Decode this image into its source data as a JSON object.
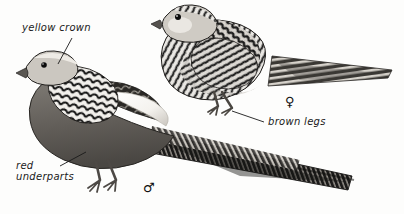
{
  "plate": {
    "background_color": "#fdfdfc",
    "ink_color": "#1a1a1a",
    "width": 404,
    "height": 214
  },
  "annotations": [
    {
      "id": "yellow-crown",
      "text": "yellow crown",
      "x": 22,
      "y": 22
    },
    {
      "id": "red-underparts",
      "text": "red\nunderparts",
      "x": 16,
      "y": 160
    },
    {
      "id": "brown-legs",
      "text": "brown legs",
      "x": 268,
      "y": 116
    }
  ],
  "sex_symbols": [
    {
      "id": "male",
      "glyph": "♂",
      "x": 143,
      "y": 180
    },
    {
      "id": "female",
      "glyph": "♀",
      "x": 285,
      "y": 94
    }
  ],
  "birds": [
    {
      "id": "male-pheasant",
      "sex": "male",
      "features": [
        "pale crown",
        "scalloped cape",
        "pale wing patch",
        "long barred tail",
        "dark underparts"
      ]
    },
    {
      "id": "female-pheasant",
      "sex": "female",
      "features": [
        "streaked plumage",
        "barred tail",
        "pale throat"
      ]
    }
  ]
}
